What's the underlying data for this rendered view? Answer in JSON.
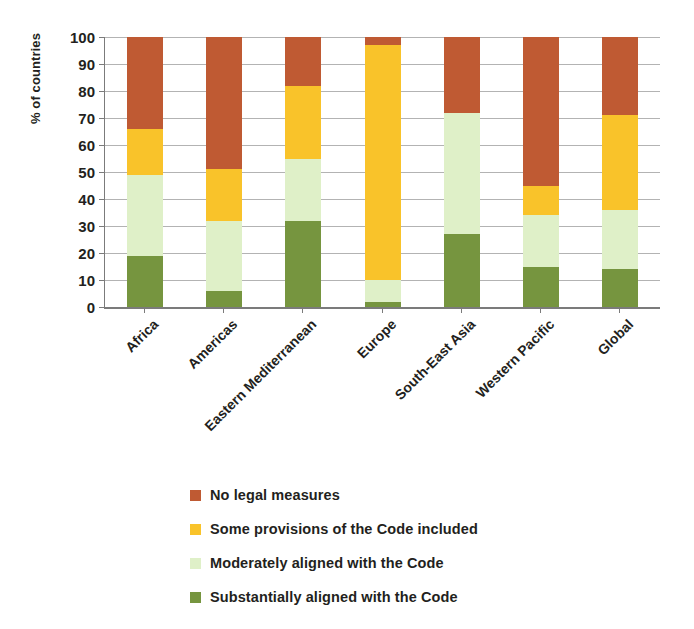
{
  "chart_data": {
    "type": "bar",
    "subtype": "stacked-bar-100-percent",
    "title": "",
    "xlabel": "",
    "ylabel": "% of countries",
    "ylim": [
      0,
      100
    ],
    "ytick_labels": [
      "0",
      "10",
      "20",
      "30",
      "40",
      "50",
      "60",
      "70",
      "80",
      "90",
      "100"
    ],
    "ytick_values": [
      0,
      10,
      20,
      30,
      40,
      50,
      60,
      70,
      80,
      90,
      100
    ],
    "grid": true,
    "legend_position": "bottom",
    "categories": [
      "Africa",
      "Americas",
      "Eastern Mediterranean",
      "Europe",
      "South-East Asia",
      "Western Pacific",
      "Global"
    ],
    "series": [
      {
        "name": "Substantially aligned with the Code",
        "color": "#76953F",
        "values": [
          19,
          6,
          32,
          2,
          27,
          15,
          14
        ]
      },
      {
        "name": "Moderately aligned with the Code",
        "color": "#DFF0C8",
        "values": [
          30,
          26,
          23,
          8,
          45,
          19,
          22
        ]
      },
      {
        "name": "Some provisions of the Code included",
        "color": "#F9C32A",
        "values": [
          17,
          19,
          27,
          87,
          0,
          11,
          35
        ]
      },
      {
        "name": "No legal measures",
        "color": "#BF5A33",
        "values": [
          34,
          49,
          18,
          3,
          28,
          55,
          29
        ]
      }
    ],
    "cumulative_tops": {
      "Africa": [
        19,
        49,
        66,
        100
      ],
      "Americas": [
        6,
        32,
        51,
        100
      ],
      "Eastern Mediterranean": [
        32,
        55,
        82,
        100
      ],
      "Europe": [
        2,
        10,
        97,
        100
      ],
      "South-East Asia": [
        27,
        72,
        72,
        100
      ],
      "Western Pacific": [
        15,
        34,
        45,
        100
      ],
      "Global": [
        14,
        36,
        71,
        100
      ]
    }
  },
  "legend": {
    "items": [
      {
        "label": "No legal measures",
        "color": "#BF5A33"
      },
      {
        "label": "Some provisions of the Code included",
        "color": "#F9C32A"
      },
      {
        "label": "Moderately aligned with the Code",
        "color": "#DFF0C8"
      },
      {
        "label": "Substantially aligned with the Code",
        "color": "#76953F"
      }
    ]
  },
  "axis": {
    "y_title": "% of countries"
  }
}
